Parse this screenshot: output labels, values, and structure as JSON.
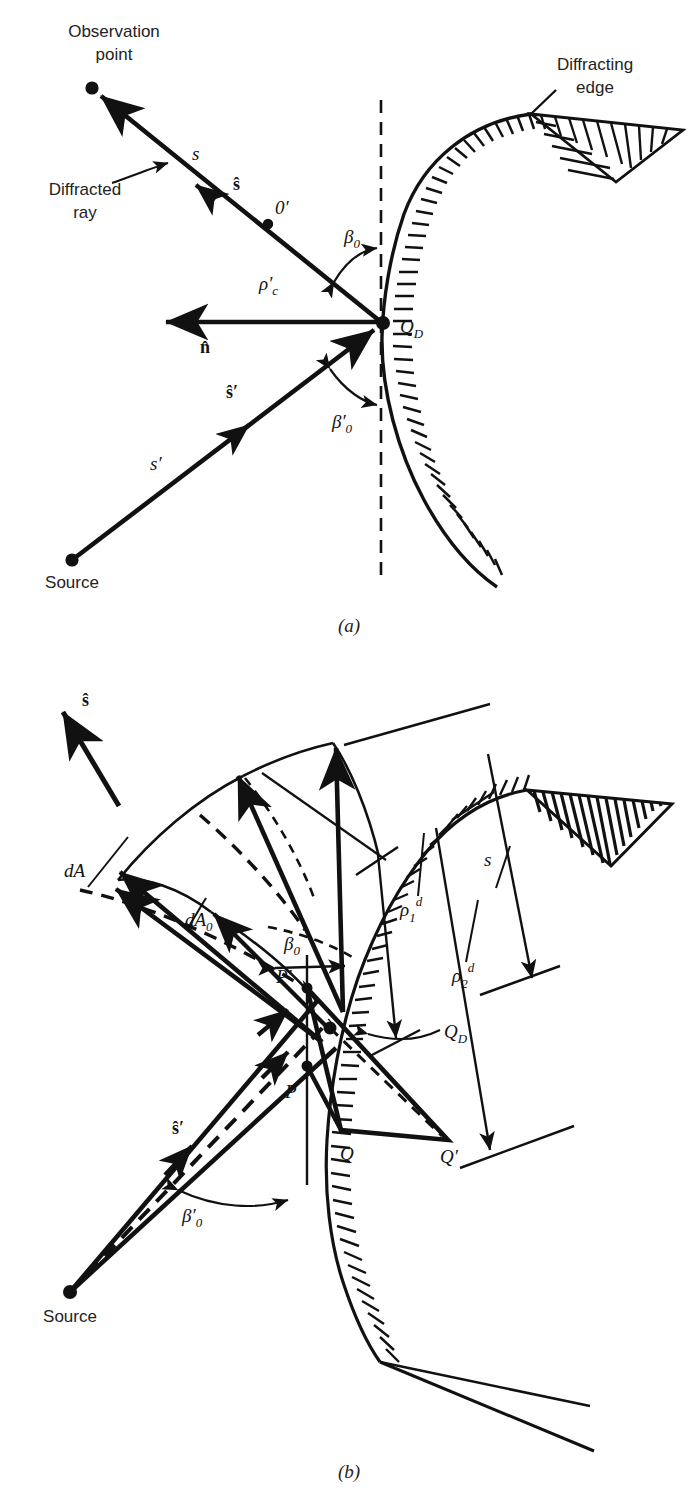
{
  "figure": {
    "panels": [
      {
        "id": "a",
        "caption": "(a)",
        "labels": {
          "observation_point_line1": "Observation",
          "observation_point_line2": "point",
          "diffracted_ray_line1": "Diffracted",
          "diffracted_ray_line2": "ray",
          "diffracting_edge_line1": "Diffracting",
          "diffracting_edge_line2": "edge",
          "source": "Source",
          "distance_s": "s",
          "unit_s_hat": "ŝ",
          "caustic_point": "0",
          "caustic_point_prime": "′",
          "rho_c": "ρ",
          "rho_c_sub": "c",
          "rho_c_prime": "′",
          "beta_0": "β",
          "beta_0_sub": "0",
          "beta_0_prime": "β",
          "beta_0_prime_mark": "′",
          "beta_0_prime_sub": "0",
          "n_hat": "n̂",
          "s_prime": "s",
          "s_prime_mark": "′",
          "s_hat_prime": "ŝ",
          "s_hat_prime_mark": "′",
          "q_d": "Q",
          "q_d_sub": "D"
        }
      },
      {
        "id": "b",
        "caption": "(b)",
        "labels": {
          "source": "Source",
          "unit_s_hat": "ŝ",
          "s_hat_prime": "ŝ",
          "s_hat_prime_mark": "′",
          "dA": "dA",
          "dA0": "dA",
          "dA0_sub": "0",
          "beta_0": "β",
          "beta_0_sub": "0",
          "beta_0_prime": "β",
          "beta_0_prime_mark": "′",
          "beta_0_prime_sub": "0",
          "rho_1_d": "ρ",
          "rho_1_sub": "1",
          "rho_1_sup": "d",
          "rho_2_d": "ρ",
          "rho_2_sub": "2",
          "rho_2_sup": "d",
          "distance_s": "s",
          "p_prime": "P",
          "p_prime_mark": "′",
          "p": "P",
          "q_d": "Q",
          "q_d_sub": "D",
          "q": "Q",
          "q_prime": "Q",
          "q_prime_mark": "′"
        }
      }
    ]
  },
  "style": {
    "ink": "#111111",
    "text": "#232323",
    "background": "#ffffff"
  }
}
